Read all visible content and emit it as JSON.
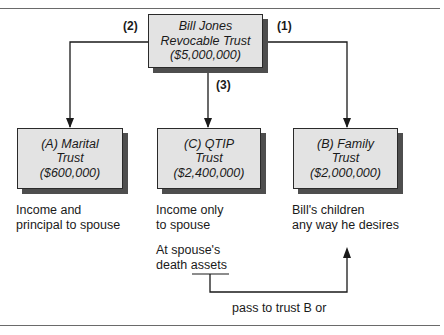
{
  "diagram": {
    "root": {
      "lines": [
        "Bill Jones",
        "Revocable Trust",
        "($5,000,000)"
      ]
    },
    "trusts": [
      {
        "id": "A",
        "lines": [
          "(A) Marital",
          "Trust",
          "($600,000)"
        ],
        "description": [
          "Income and",
          "principal to spouse"
        ]
      },
      {
        "id": "C",
        "lines": [
          "(C) QTIP",
          "Trust",
          "($2,400,000)"
        ],
        "description": [
          "Income only",
          "to spouse"
        ]
      },
      {
        "id": "B",
        "lines": [
          "(B) Family",
          "Trust",
          "($2,000,000)"
        ],
        "description": [
          "Bill's children",
          "any way he desires"
        ]
      }
    ],
    "steps": {
      "to_a": "(2)",
      "to_b": "(1)",
      "to_c": "(3)"
    },
    "qtip_death_note": {
      "line1": "At spouse's",
      "line2_prefix": "death ",
      "line2_underlined": "assets"
    },
    "pass_label": "pass to trust B or"
  }
}
